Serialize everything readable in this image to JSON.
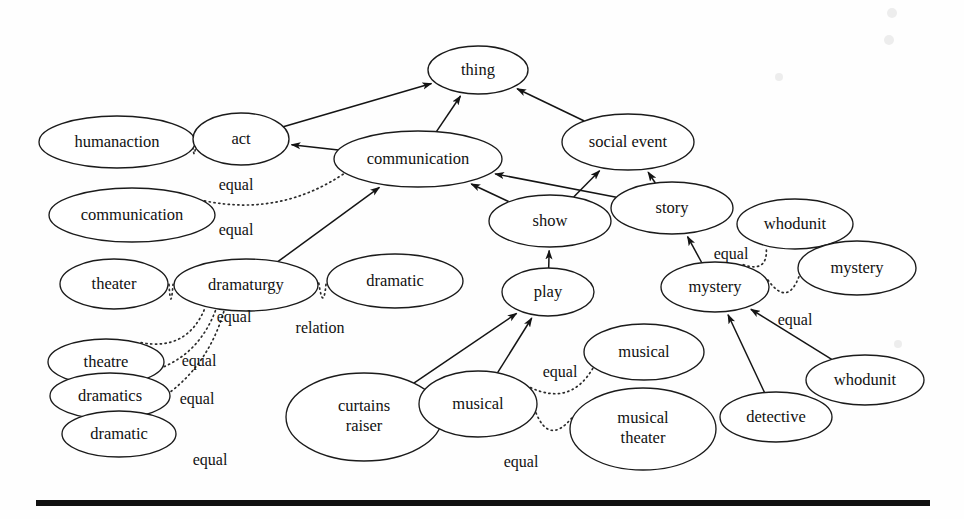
{
  "figure": {
    "kind": "ontology-graph",
    "background_color": "#fefefe",
    "line_color": "#141414",
    "node_fill": "#ffffff",
    "width": 964,
    "height": 519
  },
  "nodes": [
    {
      "id": "thing",
      "label": "thing",
      "cx": 478,
      "cy": 70,
      "rx": 50,
      "ry": 24
    },
    {
      "id": "humanaction",
      "label": "humanaction",
      "cx": 117,
      "cy": 142,
      "rx": 78,
      "ry": 26
    },
    {
      "id": "act",
      "label": "act",
      "cx": 241,
      "cy": 139,
      "rx": 48,
      "ry": 26
    },
    {
      "id": "communication_c",
      "label": "communication",
      "cx": 418,
      "cy": 159,
      "rx": 84,
      "ry": 28
    },
    {
      "id": "social_event",
      "label": "social event",
      "cx": 628,
      "cy": 142,
      "rx": 66,
      "ry": 28
    },
    {
      "id": "communication_l",
      "label": "communication",
      "cx": 132,
      "cy": 215,
      "rx": 83,
      "ry": 27
    },
    {
      "id": "show",
      "label": "show",
      "cx": 550,
      "cy": 221,
      "rx": 61,
      "ry": 26
    },
    {
      "id": "story",
      "label": "story",
      "cx": 672,
      "cy": 208,
      "rx": 61,
      "ry": 26
    },
    {
      "id": "whodunit_top",
      "label": "whodunit",
      "cx": 795,
      "cy": 224,
      "rx": 58,
      "ry": 25
    },
    {
      "id": "mystery_right",
      "label": "mystery",
      "cx": 857,
      "cy": 268,
      "rx": 59,
      "ry": 27
    },
    {
      "id": "theater",
      "label": "theater",
      "cx": 114,
      "cy": 284,
      "rx": 54,
      "ry": 25
    },
    {
      "id": "dramaturgy",
      "label": "dramaturgy",
      "cx": 246,
      "cy": 285,
      "rx": 72,
      "ry": 26
    },
    {
      "id": "dramatic_mid",
      "label": "dramatic",
      "cx": 395,
      "cy": 281,
      "rx": 68,
      "ry": 27
    },
    {
      "id": "play",
      "label": "play",
      "cx": 548,
      "cy": 292,
      "rx": 46,
      "ry": 24
    },
    {
      "id": "mystery_left",
      "label": "mystery",
      "cx": 715,
      "cy": 287,
      "rx": 54,
      "ry": 25
    },
    {
      "id": "theatre",
      "label": "theatre",
      "cx": 106,
      "cy": 362,
      "rx": 58,
      "ry": 23
    },
    {
      "id": "musical_solo",
      "label": "musical",
      "cx": 644,
      "cy": 352,
      "rx": 60,
      "ry": 28
    },
    {
      "id": "dramatics",
      "label": "dramatics",
      "cx": 110,
      "cy": 396,
      "rx": 60,
      "ry": 23
    },
    {
      "id": "whodunit_bottom",
      "label": "whodunit",
      "cx": 865,
      "cy": 380,
      "rx": 59,
      "ry": 25
    },
    {
      "id": "curtains_raiser",
      "label": "curtains raiser",
      "cx": 364,
      "cy": 417,
      "rx": 78,
      "ry": 44
    },
    {
      "id": "musical_link",
      "label": "musical",
      "cx": 478,
      "cy": 404,
      "rx": 59,
      "ry": 33
    },
    {
      "id": "dramatic_bot",
      "label": "dramatic",
      "cx": 119,
      "cy": 434,
      "rx": 57,
      "ry": 23
    },
    {
      "id": "detective",
      "label": "detective",
      "cx": 776,
      "cy": 417,
      "rx": 56,
      "ry": 25
    },
    {
      "id": "musical_theater",
      "label": "musical theater",
      "cx": 643,
      "cy": 429,
      "rx": 73,
      "ry": 41
    }
  ],
  "edges_solid": [
    {
      "from": "act",
      "to": "thing",
      "kind": "isa"
    },
    {
      "from": "communication_c",
      "to": "act",
      "kind": "isa"
    },
    {
      "from": "communication_c",
      "to": "thing",
      "kind": "isa"
    },
    {
      "from": "social_event",
      "to": "thing",
      "kind": "isa"
    },
    {
      "from": "dramaturgy",
      "to": "communication_c",
      "kind": "isa"
    },
    {
      "from": "show",
      "to": "communication_c",
      "kind": "isa"
    },
    {
      "from": "show",
      "to": "social_event",
      "kind": "isa"
    },
    {
      "from": "story",
      "to": "communication_c",
      "kind": "isa"
    },
    {
      "from": "story",
      "to": "social_event",
      "kind": "isa"
    },
    {
      "from": "play",
      "to": "show",
      "kind": "isa"
    },
    {
      "from": "mystery_left",
      "to": "story",
      "kind": "isa"
    },
    {
      "from": "curtains_raiser",
      "to": "play",
      "kind": "isa"
    },
    {
      "from": "musical_link",
      "to": "play",
      "kind": "isa"
    },
    {
      "from": "detective",
      "to": "mystery_left",
      "kind": "isa"
    },
    {
      "from": "whodunit_bottom",
      "to": "mystery_left",
      "kind": "isa"
    }
  ],
  "edges_dotted": [
    {
      "from": "humanaction",
      "to": "act",
      "label": "equal",
      "label_x": 236,
      "label_y": 186
    },
    {
      "from": "communication_l",
      "to": "communication_c",
      "label": "equal",
      "label_x": 236,
      "label_y": 231
    },
    {
      "from": "theater",
      "to": "dramaturgy",
      "label": "equal",
      "label_x": 234,
      "label_y": 318
    },
    {
      "from": "dramaturgy",
      "to": "dramatic_mid",
      "label": "relation",
      "label_x": 320,
      "label_y": 329
    },
    {
      "from": "theatre",
      "to": "dramaturgy",
      "label": "equal",
      "label_x": 199,
      "label_y": 362
    },
    {
      "from": "dramatics",
      "to": "dramaturgy",
      "label": "equal",
      "label_x": 197,
      "label_y": 400
    },
    {
      "from": "dramatic_bot",
      "to": "dramaturgy",
      "label": "equal",
      "label_x": 210,
      "label_y": 461
    },
    {
      "from": "mystery_left",
      "to": "whodunit_top",
      "label": "equal",
      "label_x": 731,
      "label_y": 255
    },
    {
      "from": "mystery_left",
      "to": "mystery_right",
      "label": "equal",
      "label_x": 795,
      "label_y": 321
    },
    {
      "from": "musical_link",
      "to": "musical_solo",
      "label": "equal",
      "label_x": 560,
      "label_y": 373
    },
    {
      "from": "musical_link",
      "to": "musical_theater",
      "label": "equal",
      "label_x": 521,
      "label_y": 463
    }
  ],
  "bottom_rule": {
    "x": 36,
    "y": 500,
    "width": 894,
    "height": 6
  },
  "scan_artifacts": [
    {
      "cx": 892,
      "cy": 13,
      "r": 5
    },
    {
      "cx": 889,
      "cy": 40,
      "r": 5
    },
    {
      "cx": 779,
      "cy": 77,
      "r": 4
    },
    {
      "cx": 898,
      "cy": 344,
      "r": 4
    }
  ]
}
